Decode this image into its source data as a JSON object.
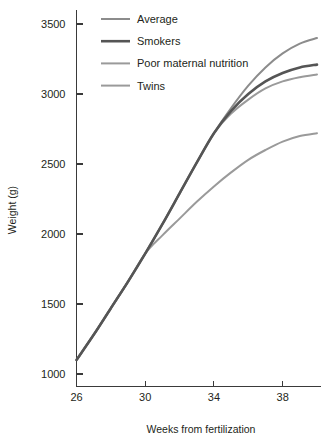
{
  "chart_data": {
    "type": "line",
    "title": "",
    "subtitle": "",
    "xlabel": "Weeks from fertilization",
    "ylabel": "Weight (g)",
    "xlim": [
      26,
      40
    ],
    "ylim": [
      950,
      3600
    ],
    "xticks": [
      26,
      30,
      34,
      38
    ],
    "yticks": [
      1000,
      1500,
      2000,
      2500,
      3000,
      3500
    ],
    "xtick_labels": [
      "26",
      "30",
      "34",
      "38"
    ],
    "ytick_labels": [
      "1000",
      "1500",
      "2000",
      "2500",
      "3000",
      "3500"
    ],
    "grid": false,
    "legend_position": "top-left-inside",
    "x": [
      26,
      27,
      28,
      29,
      30,
      31,
      32,
      33,
      34,
      35,
      36,
      37,
      38,
      39,
      40
    ],
    "series": [
      {
        "name": "Average",
        "color": "#8c8c8c",
        "linewidth": 2.0,
        "values": [
          1100,
          1280,
          1470,
          1660,
          1860,
          2070,
          2290,
          2510,
          2720,
          2900,
          3060,
          3190,
          3290,
          3360,
          3400
        ]
      },
      {
        "name": "Smokers",
        "color": "#555555",
        "linewidth": 2.6,
        "values": [
          1100,
          1280,
          1470,
          1660,
          1860,
          2070,
          2290,
          2510,
          2720,
          2880,
          3000,
          3090,
          3150,
          3190,
          3210
        ]
      },
      {
        "name": "Poor maternal nutrition",
        "color": "#9a9a9a",
        "linewidth": 2.0,
        "values": [
          1100,
          1280,
          1470,
          1660,
          1860,
          2070,
          2290,
          2510,
          2720,
          2860,
          2960,
          3040,
          3090,
          3120,
          3140
        ]
      },
      {
        "name": "Twins",
        "color": "#9a9a9a",
        "linewidth": 2.0,
        "values": [
          1100,
          1280,
          1470,
          1660,
          1860,
          1990,
          2110,
          2230,
          2340,
          2440,
          2530,
          2600,
          2660,
          2700,
          2720
        ]
      }
    ]
  },
  "legend": {
    "entries": [
      {
        "label": "Average"
      },
      {
        "label": "Smokers"
      },
      {
        "label": "Poor maternal nutrition"
      },
      {
        "label": "Twins"
      }
    ]
  },
  "axes": {
    "x_title": "Weeks from fertilization",
    "y_title": "Weight (g)"
  }
}
